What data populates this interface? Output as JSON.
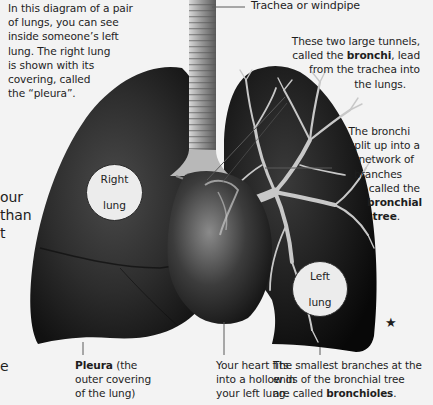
{
  "intro": {
    "lines": [
      "In this diagram of a pair",
      "of lungs, you can see",
      "inside someone’s left",
      "lung. The right lung",
      "is shown with its",
      "covering, called",
      "the “pleura”."
    ]
  },
  "labels": {
    "trachea": "Trachea or windpipe",
    "bronchi": {
      "lines": [
        {
          "pre": "These two large tunnels,",
          "bold": "",
          "post": ""
        },
        {
          "pre": "called the ",
          "bold": "bronchi",
          "post": ", lead"
        },
        {
          "pre": "from the trachea into",
          "bold": "",
          "post": ""
        },
        {
          "pre": "the lungs.",
          "bold": "",
          "post": ""
        }
      ]
    },
    "bronchial_tree": {
      "lines": [
        {
          "pre": "The bronchi",
          "bold": "",
          "post": ""
        },
        {
          "pre": "split up into a",
          "bold": "",
          "post": ""
        },
        {
          "pre": "network of",
          "bold": "",
          "post": ""
        },
        {
          "pre": "branches",
          "bold": "",
          "post": ""
        },
        {
          "pre": "called the",
          "bold": "",
          "post": ""
        },
        {
          "pre": "",
          "bold": "bronchial",
          "post": ""
        },
        {
          "pre": "",
          "bold": "tree",
          "post": "."
        }
      ]
    },
    "pleura": {
      "lines": [
        {
          "pre": "",
          "bold": "Pleura",
          "post": " (the"
        },
        {
          "pre": "outer covering",
          "bold": "",
          "post": ""
        },
        {
          "pre": "of the lung)",
          "bold": "",
          "post": ""
        }
      ]
    },
    "heart": {
      "lines": [
        {
          "pre": "Your heart fits",
          "bold": "",
          "post": ""
        },
        {
          "pre": "into a hollow in",
          "bold": "",
          "post": ""
        },
        {
          "pre": "your left lung.",
          "bold": "",
          "post": ""
        }
      ]
    },
    "bronchioles": {
      "lines": [
        {
          "pre": "The smallest branches at the",
          "bold": "",
          "post": ""
        },
        {
          "pre": "ends of the bronchial tree",
          "bold": "",
          "post": ""
        },
        {
          "pre": "are called ",
          "bold": "bronchioles",
          "post": "."
        }
      ]
    },
    "right_lung_circle": {
      "line1": "Right",
      "line2": "lung"
    },
    "left_lung_circle": {
      "line1": "Left",
      "line2": "lung"
    }
  },
  "cut_off_text": {
    "left_middle": [
      "our",
      "than",
      "t"
    ],
    "left_bottom": [
      "e"
    ]
  },
  "decoration": {
    "star": "★"
  },
  "colors": {
    "background": "#f3f3f3",
    "lung_dark": "#1a1a1a",
    "lung_mid": "#3a3a3a",
    "bronchi_light": "#c9c9c9",
    "text": "#1e1e1e",
    "pointer_line": "#555555"
  }
}
